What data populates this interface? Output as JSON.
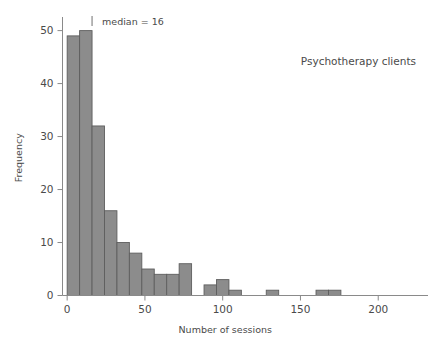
{
  "chart_data": {
    "type": "bar",
    "subtype": "histogram",
    "title": "",
    "series_label": "Psychotherapy clients",
    "xlabel": "Number of sessions",
    "ylabel": "Frequency",
    "xlim": [
      -3,
      232
    ],
    "ylim": [
      0,
      52
    ],
    "xticks": [
      0,
      50,
      100,
      150,
      200
    ],
    "xtick_labels": [
      "0",
      "50",
      "100",
      "150",
      "200"
    ],
    "yticks": [
      0,
      10,
      20,
      30,
      40,
      50
    ],
    "ytick_labels": [
      "0",
      "10",
      "20",
      "30",
      "40",
      "50"
    ],
    "grid": false,
    "legend": "none",
    "bin_width": 8,
    "bin_starts": [
      0,
      8,
      16,
      24,
      32,
      40,
      48,
      56,
      64,
      72,
      80,
      88,
      96,
      104,
      112,
      120,
      128,
      136,
      144,
      152,
      160,
      168
    ],
    "categories": [
      "0-8",
      "8-16",
      "16-24",
      "24-32",
      "32-40",
      "40-48",
      "48-56",
      "56-64",
      "64-72",
      "72-80",
      "80-88",
      "88-96",
      "96-104",
      "104-112",
      "112-120",
      "120-128",
      "128-136",
      "136-144",
      "144-152",
      "152-160",
      "160-168",
      "168-176"
    ],
    "values": [
      49,
      50,
      32,
      16,
      10,
      8,
      5,
      4,
      4,
      6,
      0,
      2,
      3,
      1,
      0,
      0,
      1,
      0,
      0,
      0,
      1,
      1
    ],
    "bar_color": "#8c8c8c",
    "bar_edge_color": "#5e5e5e",
    "axis_color": "#8a8a8a",
    "text_color": "#4a4a4a",
    "annotations": [
      {
        "name": "median-marker",
        "text": "median = 16",
        "x_value": 16,
        "y_value": 52,
        "marker": "tick"
      }
    ]
  }
}
